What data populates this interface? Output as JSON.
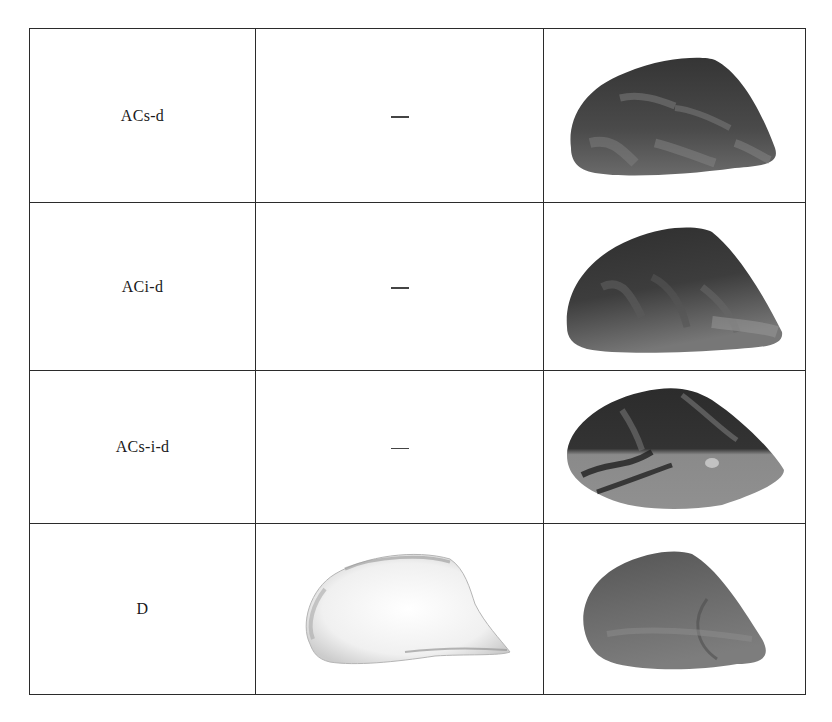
{
  "table": {
    "rows": [
      {
        "label": "ACs-d",
        "middle": "—",
        "middle_type": "dash",
        "right_image": "shell-dark-striped",
        "height": 174
      },
      {
        "label": "ACi-d",
        "middle": "—",
        "middle_type": "dash",
        "right_image": "shell-dark-mottled",
        "height": 168
      },
      {
        "label": "ACs-i-d",
        "middle": "—",
        "middle_type": "dash",
        "right_image": "shell-dark-banded-light-underside",
        "height": 153
      },
      {
        "label": "D",
        "middle": "",
        "middle_type": "image",
        "middle_image": "shell-white-outline",
        "right_image": "shell-gray-smooth",
        "height": 171
      }
    ]
  },
  "colors": {
    "border": "#2b2b2b",
    "text": "#1a1a1a",
    "shell_dark": "#3a3a3a",
    "shell_mid": "#6e6e6e",
    "shell_light": "#a0a0a0",
    "shell_white": "#f2f2f2"
  }
}
